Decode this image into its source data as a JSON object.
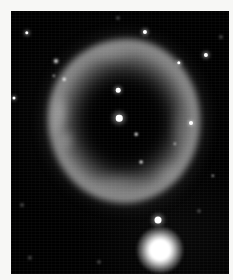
{
  "image": {
    "title": "Ring-shaped planetary nebula",
    "medium": "grayscale astronomical photograph",
    "width": 233,
    "height": 280,
    "border_color": "#f7f7f5",
    "sky_color": "#000000",
    "border": {
      "left": 11,
      "top": 11,
      "right": 4,
      "bottom": 6
    }
  },
  "sky_field": {
    "x": 11,
    "y": 11,
    "width": 218,
    "height": 263
  },
  "nebula": {
    "label": "annular planetary nebula",
    "center_x": 119,
    "center_y": 122,
    "outer_radius_x": 74,
    "outer_radius_y": 80,
    "cavity_radius_x": 32,
    "cavity_radius_y": 34,
    "ring_brightness": "#a8a8a8",
    "halo_brightness": "#6a6a6a",
    "cavity_brightness": "#060606",
    "knots": [
      {
        "name": "west-limb-filament",
        "x": 60,
        "y": 112,
        "rx": 9,
        "ry": 17,
        "alpha": 0.42,
        "blur": 3.5
      },
      {
        "name": "southwest-limb-knot",
        "x": 66,
        "y": 140,
        "rx": 8,
        "ry": 11,
        "alpha": 0.36,
        "blur": 3.5
      },
      {
        "name": "west-bright-arc",
        "x": 57,
        "y": 126,
        "rx": 6,
        "ry": 12,
        "alpha": 0.3,
        "blur": 4.0
      },
      {
        "name": "north-limb-brightening",
        "x": 112,
        "y": 54,
        "rx": 22,
        "ry": 8,
        "alpha": 0.22,
        "blur": 5.0
      },
      {
        "name": "south-limb-brightening",
        "x": 118,
        "y": 183,
        "rx": 26,
        "ry": 9,
        "alpha": 0.26,
        "blur": 5.0
      },
      {
        "name": "east-limb-brightening",
        "x": 180,
        "y": 128,
        "rx": 8,
        "ry": 22,
        "alpha": 0.2,
        "blur": 5.0
      },
      {
        "name": "southeast-outer-wisp",
        "x": 168,
        "y": 172,
        "rx": 12,
        "ry": 9,
        "alpha": 0.18,
        "blur": 5.0
      }
    ]
  },
  "stars": [
    {
      "name": "central-star",
      "x": 119,
      "y": 118,
      "size": 6.5,
      "class": "soft",
      "glow": 17
    },
    {
      "name": "cavity-star-north",
      "x": 118,
      "y": 90,
      "size": 4.6,
      "class": "soft",
      "glow": 11
    },
    {
      "name": "ring-edge-star-east",
      "x": 191,
      "y": 123,
      "size": 4.0,
      "class": "soft",
      "glow": 9
    },
    {
      "name": "field-star-upper-right-1",
      "x": 145,
      "y": 32,
      "size": 4.2,
      "class": "soft",
      "glow": 10
    },
    {
      "name": "field-star-upper-right-2",
      "x": 206,
      "y": 55,
      "size": 4.2,
      "class": "soft",
      "glow": 10
    },
    {
      "name": "field-star-upper-right-3",
      "x": 179,
      "y": 63,
      "size": 3.4,
      "class": "soft",
      "glow": 8
    },
    {
      "name": "field-star-upper-left-1",
      "x": 27,
      "y": 33,
      "size": 3.4,
      "class": "soft",
      "glow": 8
    },
    {
      "name": "field-star-upper-left-2",
      "x": 56,
      "y": 61,
      "size": 3.0,
      "class": "blur1",
      "glow": 7
    },
    {
      "name": "field-star-upper-left-3",
      "x": 54,
      "y": 76,
      "size": 2.4,
      "class": "blur1",
      "glow": 0
    },
    {
      "name": "field-star-left-edge",
      "x": 14,
      "y": 98,
      "size": 3.0,
      "class": "soft",
      "glow": 7
    },
    {
      "name": "field-star-nebula-nw",
      "x": 64,
      "y": 79,
      "size": 2.6,
      "class": "blur1",
      "glow": 0
    },
    {
      "name": "field-star-nebula-south",
      "x": 141,
      "y": 162,
      "size": 2.8,
      "class": "blur1",
      "glow": 0
    },
    {
      "name": "field-star-nebula-inner-se",
      "x": 136,
      "y": 134,
      "size": 2.6,
      "class": "blur1",
      "glow": 0
    },
    {
      "name": "field-star-nebula-ese",
      "x": 175,
      "y": 144,
      "size": 2.4,
      "class": "blur1",
      "glow": 0
    },
    {
      "name": "field-star-lower-right-1",
      "x": 213,
      "y": 176,
      "size": 2.4,
      "class": "blur1",
      "glow": 0
    },
    {
      "name": "field-star-lower-right-2",
      "x": 199,
      "y": 211,
      "size": 2.0,
      "class": "blur2",
      "glow": 0
    },
    {
      "name": "field-star-lower-left-1",
      "x": 22,
      "y": 205,
      "size": 2.0,
      "class": "blur2",
      "glow": 0
    },
    {
      "name": "field-star-lower-left-2",
      "x": 30,
      "y": 258,
      "size": 2.4,
      "class": "blur2",
      "glow": 0
    },
    {
      "name": "field-star-bottom-mid",
      "x": 99,
      "y": 262,
      "size": 2.0,
      "class": "blur2",
      "glow": 0
    },
    {
      "name": "field-star-top-mid",
      "x": 118,
      "y": 18,
      "size": 2.2,
      "class": "blur2",
      "glow": 0
    },
    {
      "name": "field-star-top-right-edge",
      "x": 221,
      "y": 37,
      "size": 2.2,
      "class": "blur2",
      "glow": 0
    },
    {
      "name": "field-star-bright-small",
      "x": 158,
      "y": 220,
      "size": 7.0,
      "class": "soft",
      "glow": 16
    }
  ],
  "bright_star": {
    "name": "saturated-foreground-star",
    "x": 160,
    "y": 250,
    "halo_size": 46,
    "core_size": 20,
    "spikes": [
      {
        "angle": -38,
        "length": 30,
        "thickness": 2.0
      },
      {
        "angle": 16,
        "length": 26,
        "thickness": 1.6
      },
      {
        "angle": 74,
        "length": 22,
        "thickness": 1.4
      }
    ]
  }
}
